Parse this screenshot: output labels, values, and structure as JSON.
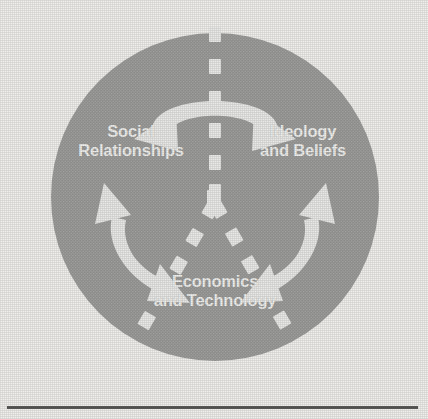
{
  "figure": {
    "shape": "circle",
    "background_color": "#f0efec",
    "circle_color": "#949492",
    "arrow_color": "#e3e3e1",
    "label_color": "#efefed",
    "rule_color": "#4e4e4c"
  },
  "nodes": [
    {
      "id": "social-relationships",
      "line1": "Social",
      "line2": "Relationships",
      "position": "top-left"
    },
    {
      "id": "ideology-and-beliefs",
      "line1": "Ideology",
      "line2": "and Beliefs",
      "position": "top-right"
    },
    {
      "id": "economics-and-technology",
      "line1": "Economics",
      "line2": "and Technology",
      "position": "bottom-center"
    }
  ],
  "connectors": [
    {
      "id": "social-ideology",
      "from": "social-relationships",
      "to": "ideology-and-beliefs",
      "style": "double-headed curved arrow",
      "arrowheads": 2
    },
    {
      "id": "social-economics",
      "from": "social-relationships",
      "to": "economics-and-technology",
      "style": "double-headed curved arrow",
      "arrowheads": 2
    },
    {
      "id": "ideology-economics",
      "from": "ideology-and-beliefs",
      "to": "economics-and-technology",
      "style": "double-headed curved arrow",
      "arrowheads": 2
    }
  ],
  "dividers": [
    {
      "id": "divider-top",
      "style": "dashed",
      "direction": "from center upward"
    },
    {
      "id": "divider-lower-left",
      "style": "dashed",
      "direction": "from center to lower left"
    },
    {
      "id": "divider-lower-right",
      "style": "dashed",
      "direction": "from center to lower right"
    }
  ]
}
